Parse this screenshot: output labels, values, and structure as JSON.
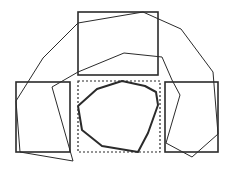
{
  "diagram": {
    "width": 229,
    "height": 170,
    "background": "#ffffff",
    "stroke_color": "#2b2b2b",
    "rectangles": [
      {
        "name": "top-rectangle",
        "x": 78,
        "y": 12,
        "w": 80,
        "h": 63,
        "style": "solid",
        "width": 1.6
      },
      {
        "name": "left-rectangle",
        "x": 16,
        "y": 82,
        "w": 54,
        "h": 70,
        "style": "solid",
        "width": 1.6
      },
      {
        "name": "right-rectangle",
        "x": 165,
        "y": 82,
        "w": 53,
        "h": 70,
        "style": "solid",
        "width": 1.6
      },
      {
        "name": "center-dashed-rectangle",
        "x": 78,
        "y": 81,
        "w": 82,
        "h": 71,
        "style": "dashed",
        "width": 1.2
      }
    ],
    "polygons": [
      {
        "name": "outer-arch-polygon",
        "style": "thin",
        "width": 1,
        "points": "16,101 43,58 78,23 143,12 181,29 213,72 218,134 192,157 166,143 180,95 172,80 162,57 124,53 78,72 52,87 73,161 20,152 16,101"
      },
      {
        "name": "inner-octagon",
        "style": "bold",
        "width": 2,
        "points": "78,106 82,130 102,146 138,152 148,133 158,105 156,92 145,86 122,81 97,89"
      }
    ]
  }
}
